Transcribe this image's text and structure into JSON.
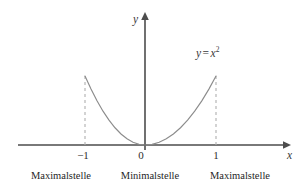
{
  "figure": {
    "background_color": "#ffffff",
    "curve_color": "#8c8c8c",
    "axis_color": "#4d4d4d",
    "dashed_color": "#b0b0b0",
    "text_color": "#1f1f1f"
  },
  "axes": {
    "y_label": "y",
    "x_label": "x",
    "x_axis_arrow": "arrow-right-icon",
    "y_axis_arrow": "arrow-up-icon"
  },
  "function_label": {
    "lhs": "y",
    "operator": "=",
    "base": "x",
    "exponent": "2",
    "full_text": "y = x²"
  },
  "ticks": {
    "x": [
      {
        "value": -1,
        "label": "−1"
      },
      {
        "value": 0,
        "label": "0"
      },
      {
        "value": 1,
        "label": "1"
      }
    ]
  },
  "captions": [
    {
      "label": "Maximalstelle",
      "at_x": -1
    },
    {
      "label": "Minimalstelle",
      "at_x": 0
    },
    {
      "label": "Maximalstelle",
      "at_x": 1
    }
  ],
  "annotations": {
    "dashed_drop_lines": [
      {
        "x": -1,
        "y": 1
      },
      {
        "x": 1,
        "y": 1
      }
    ]
  },
  "chart_data": {
    "type": "line",
    "title": "",
    "subtitle": "",
    "xlabel": "x",
    "ylabel": "y",
    "xlim": [
      -1.95,
      2.1
    ],
    "ylim": [
      -0.05,
      1.45
    ],
    "grid": false,
    "legend": "none",
    "annotations": [
      {
        "text": "y = x²",
        "x": 1.05,
        "y": 1.32
      },
      {
        "text": "Maximalstelle",
        "x": -1,
        "y": -0.32
      },
      {
        "text": "Minimalstelle",
        "x": 0,
        "y": -0.32
      },
      {
        "text": "Maximalstelle",
        "x": 1,
        "y": -0.32
      }
    ],
    "series": [
      {
        "name": "y = x²",
        "x": [
          -1.0,
          -0.9,
          -0.8,
          -0.7,
          -0.6,
          -0.5,
          -0.4,
          -0.3,
          -0.2,
          -0.1,
          0.0,
          0.1,
          0.2,
          0.3,
          0.4,
          0.5,
          0.6,
          0.7,
          0.8,
          0.9,
          1.0
        ],
        "values": [
          1.0,
          0.81,
          0.64,
          0.49,
          0.36,
          0.25,
          0.16,
          0.09,
          0.04,
          0.01,
          0.0,
          0.01,
          0.04,
          0.09,
          0.16,
          0.25,
          0.36,
          0.49,
          0.64,
          0.81,
          1.0
        ]
      }
    ],
    "markers": [
      {
        "label": "Maximalstelle",
        "x": -1,
        "y": 1
      },
      {
        "label": "Minimalstelle",
        "x": 0,
        "y": 0
      },
      {
        "label": "Maximalstelle",
        "x": 1,
        "y": 1
      }
    ]
  }
}
